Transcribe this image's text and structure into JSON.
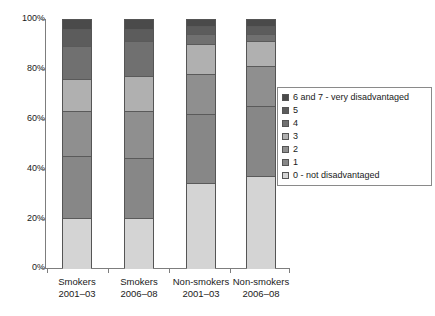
{
  "chart_data": {
    "type": "bar",
    "subtype": "stacked-percentage",
    "title": "",
    "xlabel": "",
    "ylabel": "",
    "ylim": [
      0,
      100
    ],
    "ytick_labels": [
      "0%",
      "20%",
      "40%",
      "60%",
      "80%",
      "100%"
    ],
    "ytick_values": [
      0,
      20,
      40,
      60,
      80,
      100
    ],
    "grid": false,
    "legend_position": "right",
    "categories": [
      {
        "line1": "Smokers",
        "line2": "2001–03"
      },
      {
        "line1": "Smokers",
        "line2": "2006–08"
      },
      {
        "line1": "Non-smokers",
        "line2": "2001–03"
      },
      {
        "line1": "Non-smokers",
        "line2": "2006–08"
      }
    ],
    "category_labels": [
      "Smokers 2001–03",
      "Smokers 2006–08",
      "Non-smokers 2001–03",
      "Non-smokers 2006–08"
    ],
    "series": [
      {
        "name": "0 - not disadvantaged",
        "color": "#d4d4d4",
        "values": [
          20,
          20,
          34,
          37
        ]
      },
      {
        "name": "1",
        "color": "#878787",
        "values": [
          25,
          24,
          28,
          28
        ]
      },
      {
        "name": "2",
        "color": "#8f8f8f",
        "values": [
          18,
          19,
          16,
          16
        ]
      },
      {
        "name": "3",
        "color": "#b0b0b0",
        "values": [
          13,
          14,
          12,
          10
        ]
      },
      {
        "name": "4",
        "color": "#707070",
        "values": [
          13,
          14,
          4,
          3
        ]
      },
      {
        "name": "5",
        "color": "#5c5c5c",
        "values": [
          7,
          5,
          3,
          3
        ]
      },
      {
        "name": "6 and 7 - very disadvantaged",
        "color": "#4a4a4a",
        "values": [
          4,
          4,
          3,
          3
        ]
      }
    ],
    "cumulative_boundaries": {
      "Smokers 2001–03": [
        0,
        20,
        45,
        63,
        76,
        89,
        96,
        100
      ],
      "Smokers 2006–08": [
        0,
        20,
        44,
        63,
        77,
        91,
        96,
        100
      ],
      "Non-smokers 2001–03": [
        0,
        34,
        62,
        78,
        90,
        94,
        97,
        100
      ],
      "Non-smokers 2006–08": [
        0,
        37,
        65,
        81,
        91,
        94,
        97,
        100
      ]
    }
  },
  "legend": {
    "items": [
      {
        "label": "6 and 7 - very disadvantaged",
        "color": "#4a4a4a"
      },
      {
        "label": "5",
        "color": "#5c5c5c"
      },
      {
        "label": "4",
        "color": "#707070"
      },
      {
        "label": "3",
        "color": "#b0b0b0"
      },
      {
        "label": "2",
        "color": "#8f8f8f"
      },
      {
        "label": "1",
        "color": "#878787"
      },
      {
        "label": "0 - not disadvantaged",
        "color": "#d4d4d4"
      }
    ]
  },
  "axis": {
    "y_labels": [
      "100%",
      "80%",
      "60%",
      "40%",
      "20%",
      "0%"
    ]
  },
  "colors": {
    "axis": "#7d7d7d",
    "bar_outline": "#555555",
    "background": "#ffffff",
    "text": "#1a1a1a"
  }
}
